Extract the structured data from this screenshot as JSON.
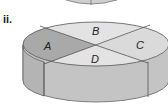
{
  "figure": {
    "label": "ii.",
    "sections": [
      {
        "id": "A",
        "label": "A",
        "color": "#a9a9a9"
      },
      {
        "id": "B",
        "label": "B",
        "color": "#e2e2e2"
      },
      {
        "id": "C",
        "label": "C",
        "color": "#dadada"
      },
      {
        "id": "D",
        "label": "D",
        "color": "#e4e4e4"
      }
    ],
    "side_color": "#c4c4c4",
    "side_left_color": "#b4b4b4",
    "outline_color": "#555555"
  }
}
